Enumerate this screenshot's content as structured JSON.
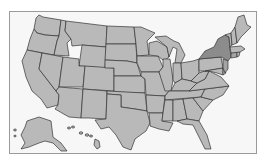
{
  "map": {
    "type": "choropleth",
    "region": "United States",
    "colors": {
      "background": "#f7f7f7",
      "frame_border": "#9a9a9a",
      "state_default": "#b9b9b9",
      "state_outline": "#333333",
      "highlight_strong": "#8c8c8c",
      "highlight_medium": "#a4a4a4"
    },
    "highlighted_states": [
      {
        "state": "New York",
        "shade": "highlight_strong"
      },
      {
        "state": "Connecticut",
        "shade": "highlight_medium"
      },
      {
        "state": "New Jersey",
        "shade": "highlight_medium"
      }
    ],
    "insets": [
      "Alaska",
      "Hawaii"
    ]
  }
}
